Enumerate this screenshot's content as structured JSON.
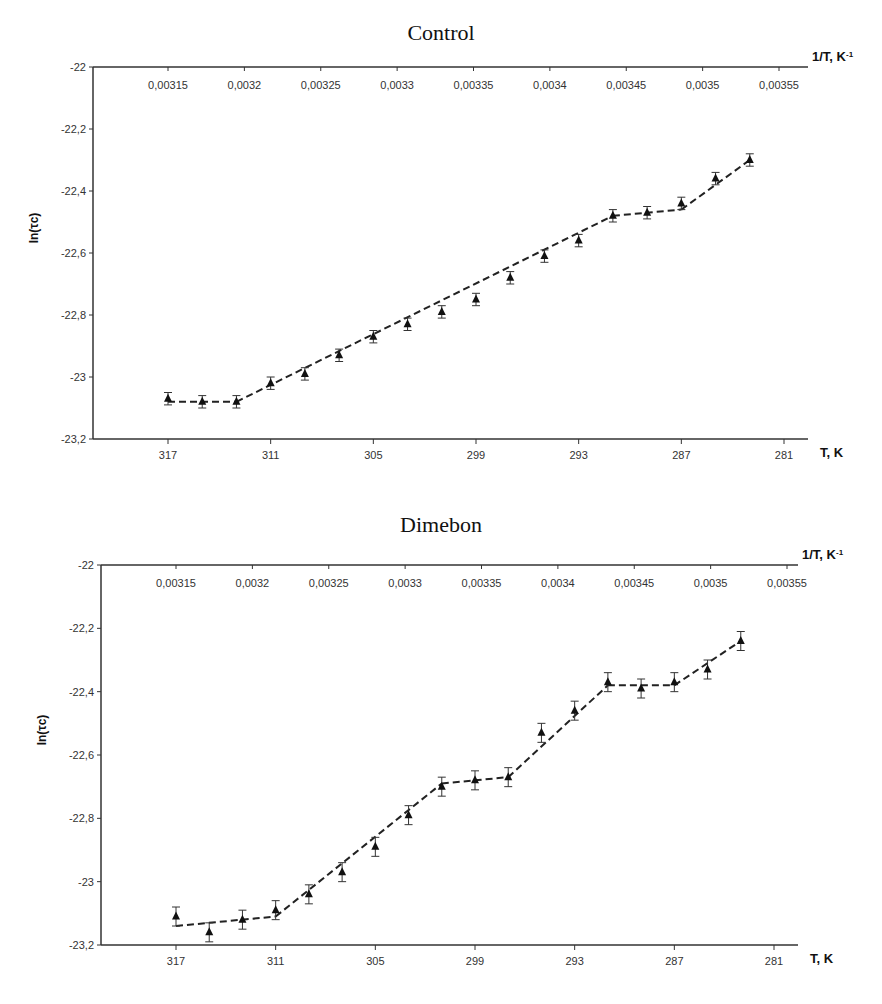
{
  "chart_data": [
    {
      "type": "line",
      "title": "Control",
      "xlabel": "T, K",
      "x2label": "1/T, K",
      "x2label_sup": "-1",
      "ylabel": "ln(τc)",
      "ylim": [
        -23.2,
        -22
      ],
      "yticks": [
        "-22",
        "-22,2",
        "-22,4",
        "-22,6",
        "-22,8",
        "-23",
        "-23,2"
      ],
      "ytick_values": [
        -22,
        -22.2,
        -22.4,
        -22.6,
        -22.8,
        -23,
        -23.2
      ],
      "xticks_T": [
        "317",
        "311",
        "305",
        "299",
        "293",
        "287",
        "281"
      ],
      "xticks_invT": [
        "0,00315",
        "0,0032",
        "0,00325",
        "0,0033",
        "0,00335",
        "0,0034",
        "0,00345",
        "0,0035",
        "0,00355"
      ],
      "grid": false,
      "marker": "triangle",
      "line_style": "dashed",
      "series": [
        {
          "name": "Control",
          "T": [
            317,
            315,
            313,
            311,
            309,
            307,
            305,
            303,
            301,
            299,
            297,
            295,
            293,
            291,
            289,
            287,
            285,
            283
          ],
          "values": [
            -23.07,
            -23.08,
            -23.08,
            -23.02,
            -22.99,
            -22.93,
            -22.87,
            -22.83,
            -22.79,
            -22.75,
            -22.68,
            -22.61,
            -22.56,
            -22.48,
            -22.47,
            -22.44,
            -22.36,
            -22.3
          ],
          "error": 0.02,
          "fit_segments": [
            {
              "from_T": 317,
              "to_T": 313,
              "from_y": -23.08,
              "to_y": -23.08
            },
            {
              "from_T": 313,
              "to_T": 291,
              "from_y": -23.08,
              "to_y": -22.48
            },
            {
              "from_T": 291,
              "to_T": 287,
              "from_y": -22.48,
              "to_y": -22.46
            },
            {
              "from_T": 287,
              "to_T": 283,
              "from_y": -22.46,
              "to_y": -22.3
            }
          ]
        }
      ]
    },
    {
      "type": "line",
      "title": "Dimebon",
      "xlabel": "T, K",
      "x2label": "1/T, K",
      "x2label_sup": "-1",
      "ylabel": "ln(τc)",
      "ylim": [
        -23.2,
        -22
      ],
      "yticks": [
        "-22",
        "-22,2",
        "-22,4",
        "-22,6",
        "-22,8",
        "-23",
        "-23,2"
      ],
      "ytick_values": [
        -22,
        -22.2,
        -22.4,
        -22.6,
        -22.8,
        -23,
        -23.2
      ],
      "xticks_T": [
        "317",
        "311",
        "305",
        "299",
        "293",
        "287",
        "281"
      ],
      "xticks_invT": [
        "0,00315",
        "0,0032",
        "0,00325",
        "0,0033",
        "0,00335",
        "0,0034",
        "0,00345",
        "0,0035",
        "0,00355"
      ],
      "grid": false,
      "marker": "triangle",
      "line_style": "dashed",
      "series": [
        {
          "name": "Dimebon",
          "T": [
            317,
            315,
            313,
            311,
            309,
            307,
            305,
            303,
            301,
            299,
            297,
            295,
            293,
            291,
            289,
            287,
            285,
            283
          ],
          "values": [
            -23.11,
            -23.16,
            -23.12,
            -23.09,
            -23.04,
            -22.97,
            -22.89,
            -22.79,
            -22.7,
            -22.68,
            -22.67,
            -22.53,
            -22.46,
            -22.37,
            -22.39,
            -22.37,
            -22.33,
            -22.24
          ],
          "error": 0.03,
          "fit_segments": [
            {
              "from_T": 317,
              "to_T": 311,
              "from_y": -23.14,
              "to_y": -23.11
            },
            {
              "from_T": 311,
              "to_T": 301,
              "from_y": -23.11,
              "to_y": -22.69
            },
            {
              "from_T": 301,
              "to_T": 297,
              "from_y": -22.69,
              "to_y": -22.67
            },
            {
              "from_T": 297,
              "to_T": 291,
              "from_y": -22.67,
              "to_y": -22.38
            },
            {
              "from_T": 291,
              "to_T": 287,
              "from_y": -22.38,
              "to_y": -22.38
            },
            {
              "from_T": 287,
              "to_T": 283,
              "from_y": -22.38,
              "to_y": -22.24
            }
          ]
        }
      ]
    }
  ]
}
